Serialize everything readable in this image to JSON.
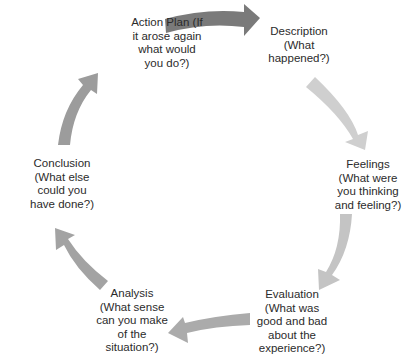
{
  "diagram": {
    "type": "cycle",
    "nodes": [
      {
        "id": "description",
        "lines": [
          "Description",
          "(What",
          "happened?)"
        ]
      },
      {
        "id": "feelings",
        "lines": [
          "Feelings",
          "(What were",
          "you thinking",
          "and feeling?)"
        ]
      },
      {
        "id": "evaluation",
        "lines": [
          "Evaluation",
          "(What was",
          "good and bad",
          "about the",
          "experience?)"
        ]
      },
      {
        "id": "analysis",
        "lines": [
          "Analysis",
          "(What sense",
          "can you make",
          "of the",
          "situation?)"
        ]
      },
      {
        "id": "conclusion",
        "lines": [
          "Conclusion",
          "(What else",
          "could you",
          "have done?)"
        ]
      },
      {
        "id": "action_plan",
        "lines": [
          "Action Plan (If",
          "it arose again",
          "what would",
          "you do?)"
        ]
      }
    ],
    "arrows": [
      {
        "from": "action_plan",
        "to": "description",
        "color": "#7a7a7a"
      },
      {
        "from": "description",
        "to": "feelings",
        "color": "#cfcfcf"
      },
      {
        "from": "feelings",
        "to": "evaluation",
        "color": "#c4c4c4"
      },
      {
        "from": "evaluation",
        "to": "analysis",
        "color": "#ababab"
      },
      {
        "from": "analysis",
        "to": "conclusion",
        "color": "#a3a3a3"
      },
      {
        "from": "conclusion",
        "to": "action_plan",
        "color": "#9c9c9c"
      }
    ]
  }
}
